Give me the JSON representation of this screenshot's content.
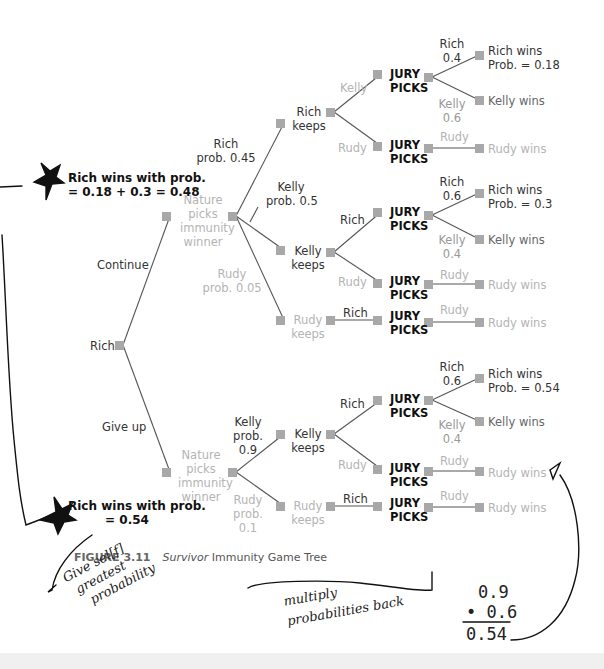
{
  "figure": {
    "caption_number": "FIGURE 3.11",
    "caption_title_italic": "Survivor",
    "caption_title_rest": "Immunity Game Tree"
  },
  "root": {
    "label": "Rich",
    "branches": {
      "continue": "Continue",
      "give_up": "Give up"
    }
  },
  "continue_branch": {
    "nature_label": [
      "Nature",
      "picks",
      "immunity",
      "winner"
    ],
    "rich_prob": [
      "Rich",
      "prob. 0.45"
    ],
    "kelly_prob": [
      "Kelly",
      "prob. 0.5"
    ],
    "rudy_prob": [
      "Rudy",
      "prob. 0.05"
    ],
    "rich_keeps": [
      "Rich",
      "keeps"
    ],
    "kelly_keeps": [
      "Kelly",
      "keeps"
    ],
    "rudy_keeps": [
      "Rudy",
      "keeps"
    ],
    "rich_keeps_moves": {
      "kelly": "Kelly",
      "rudy": "Rudy"
    },
    "kelly_keeps_moves": {
      "rich": "Rich",
      "rudy": "Rudy"
    },
    "rudy_keeps_moves": {
      "rich": "Rich"
    },
    "jury_1": {
      "label": [
        "JURY",
        "PICKS"
      ],
      "rich": [
        "Rich",
        "0.4"
      ],
      "kelly": [
        "Kelly",
        "0.6"
      ],
      "rich_outcome": [
        "Rich wins",
        "Prob. = 0.18"
      ],
      "kelly_outcome": "Kelly wins"
    },
    "jury_2": {
      "label": [
        "JURY",
        "PICKS"
      ],
      "rudy": "Rudy",
      "outcome": "Rudy wins"
    },
    "jury_3": {
      "label": [
        "JURY",
        "PICKS"
      ],
      "rich": [
        "Rich",
        "0.6"
      ],
      "kelly": [
        "Kelly",
        "0.4"
      ],
      "rich_outcome": [
        "Rich wins",
        "Prob. = 0.3"
      ],
      "kelly_outcome": "Kelly wins"
    },
    "jury_4": {
      "label": [
        "JURY",
        "PICKS"
      ],
      "rudy": "Rudy",
      "outcome": "Rudy wins"
    },
    "jury_5": {
      "label": [
        "JURY",
        "PICKS"
      ],
      "rudy": "Rudy",
      "outcome": "Rudy wins"
    },
    "result": [
      "Rich wins with prob.",
      "= 0.18 + 0.3 = 0.48"
    ]
  },
  "giveup_branch": {
    "nature_label": [
      "Nature",
      "picks",
      "immunity",
      "winner"
    ],
    "kelly_prob": [
      "Kelly",
      "prob.",
      "0.9"
    ],
    "rudy_prob": [
      "Rudy",
      "prob.",
      "0.1"
    ],
    "kelly_keeps": [
      "Kelly",
      "keeps"
    ],
    "rudy_keeps": [
      "Rudy",
      "keeps"
    ],
    "kelly_keeps_moves": {
      "rich": "Rich",
      "rudy": "Rudy"
    },
    "rudy_keeps_moves": {
      "rich": "Rich"
    },
    "jury_6": {
      "label": [
        "JURY",
        "PICKS"
      ],
      "rich": [
        "Rich",
        "0.6"
      ],
      "kelly": [
        "Kelly",
        "0.4"
      ],
      "rich_outcome": [
        "Rich wins",
        "Prob. = 0.54"
      ],
      "kelly_outcome": "Kelly wins"
    },
    "jury_7": {
      "label": [
        "JURY",
        "PICKS"
      ],
      "rudy": "Rudy",
      "outcome": "Rudy wins"
    },
    "jury_8": {
      "label": [
        "JURY",
        "PICKS"
      ],
      "rudy": "Rudy",
      "outcome": "Rudy wins"
    },
    "result": [
      "Rich wins with prob.",
      "= 0.54"
    ]
  },
  "handwriting": {
    "left_note": [
      "Give sel[f]",
      "greatest",
      "probability"
    ],
    "bottom_note": [
      "multiply",
      "probabilities back"
    ],
    "calc": [
      "0.9",
      "• 0.6",
      "0.54"
    ]
  },
  "colors": {
    "node": "#a8a8a8",
    "edge": "#555555",
    "grey_text": "#b4b4b4",
    "dark_text": "#333333",
    "ink": "#111111"
  }
}
